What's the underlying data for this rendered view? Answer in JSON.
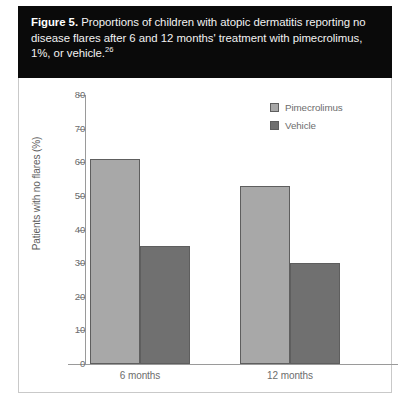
{
  "caption": {
    "label": "Figure 5.",
    "text": " Proportions of children with atopic dermatitis reporting no disease flares after 6 and 12 months' treatment with pimecrolimus, 1%, or vehicle.",
    "reference": "26"
  },
  "legend": {
    "position": "top-right",
    "items": [
      {
        "label": "Pimecrolimus",
        "color": "#a8a8a8"
      },
      {
        "label": "Vehicle",
        "color": "#707070"
      }
    ]
  },
  "colors": {
    "pimecrolimus": "#a8a8a8",
    "vehicle": "#707070",
    "bar_border": "#5e5e5e",
    "axis": "#9a9a9a",
    "caption_background": "#0a0a0a",
    "caption_text": "#ffffff",
    "tick_text": "#6d6d6d"
  },
  "chart_data": {
    "type": "bar",
    "title": "Proportions of children with atopic dermatitis reporting no disease flares after 6 and 12 months' treatment with pimecrolimus, 1%, or vehicle.",
    "xlabel": "",
    "ylabel": "Patients with no flares (%)",
    "ylim": [
      0,
      80
    ],
    "yticks": [
      0,
      10,
      20,
      30,
      40,
      50,
      60,
      70,
      80
    ],
    "ytick_labels": [
      "0",
      "10",
      "20",
      "30",
      "40",
      "50",
      "60",
      "70",
      "80"
    ],
    "grid": false,
    "legend_position": "top-right",
    "categories": [
      "6 months",
      "12 months"
    ],
    "series": [
      {
        "name": "Pimecrolimus",
        "color": "#a8a8a8",
        "values": [
          61,
          53
        ]
      },
      {
        "name": "Vehicle",
        "color": "#707070",
        "values": [
          35,
          30
        ]
      }
    ]
  }
}
